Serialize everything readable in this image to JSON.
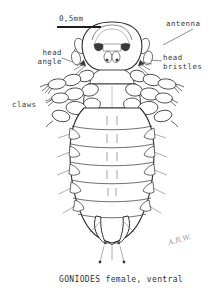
{
  "figure": {
    "organism": "GONIODES",
    "caption": "GONIODES female, ventral",
    "signature": "A.R.W.",
    "scale": {
      "text": "0,5mm",
      "bar_length_px": 44
    },
    "labels": [
      {
        "id": "antenna",
        "text": "antenna",
        "align": "left"
      },
      {
        "id": "head-bristles",
        "text": "head\nbristles",
        "align": "left"
      },
      {
        "id": "head-angle",
        "text": "head\nangle",
        "align": "right"
      },
      {
        "id": "claws",
        "text": "claws",
        "align": "left"
      }
    ],
    "colors": {
      "ink": "#2b2b2b",
      "ink_light": "#7d7d7d",
      "fill": "#ffffff",
      "shade": "#4a4a4a",
      "background": "#ffffff"
    }
  }
}
